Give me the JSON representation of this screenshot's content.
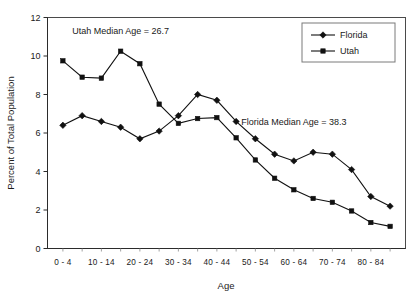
{
  "chart_data": {
    "type": "line",
    "title": "",
    "xlabel": "Age",
    "ylabel": "Percent of Total Population",
    "ylim": [
      0,
      12
    ],
    "yticks": [
      0,
      2,
      4,
      6,
      8,
      10,
      12
    ],
    "grid": false,
    "legend_position": "top-right",
    "categories": [
      "0 - 4",
      "5 - 9",
      "10 - 14",
      "15 - 19",
      "20 - 24",
      "25 - 29",
      "30 - 34",
      "35 - 39",
      "40 - 44",
      "45 - 49",
      "50 - 54",
      "55 - 59",
      "60 - 64",
      "65 - 69",
      "70 - 74",
      "75 - 79",
      "80 - 84",
      "85 +"
    ],
    "xtick_labels": [
      "0 - 4",
      "10 - 14",
      "20 - 24",
      "30 - 34",
      "40 - 44",
      "50 - 54",
      "60 - 64",
      "70 - 74",
      "80 - 84"
    ],
    "series": [
      {
        "name": "Florida",
        "marker": "diamond",
        "values": [
          6.4,
          6.9,
          6.6,
          6.3,
          5.7,
          6.1,
          6.9,
          8.0,
          7.7,
          6.6,
          5.7,
          4.9,
          4.55,
          5.0,
          4.9,
          4.1,
          2.7,
          2.2
        ]
      },
      {
        "name": "Utah",
        "marker": "square",
        "values": [
          9.75,
          8.9,
          8.85,
          10.25,
          9.6,
          7.5,
          6.5,
          6.75,
          6.8,
          5.75,
          4.6,
          3.65,
          3.05,
          2.6,
          2.4,
          1.95,
          1.35,
          1.15
        ]
      }
    ],
    "annotations": [
      {
        "text": "Utah Median Age =  26.7",
        "x_category": "15 - 19",
        "y_value": 11.15
      },
      {
        "text": "Florida Median Age = 38.3",
        "x_category": "60 - 64",
        "y_value": 6.4
      }
    ]
  },
  "legend": {
    "items": [
      {
        "label": "Florida",
        "marker": "diamond"
      },
      {
        "label": "Utah",
        "marker": "square"
      }
    ]
  },
  "colors": {
    "series": "#111111",
    "axis": "#2b2b2b",
    "frame": "#4a4a4a",
    "background": "#ffffff"
  }
}
